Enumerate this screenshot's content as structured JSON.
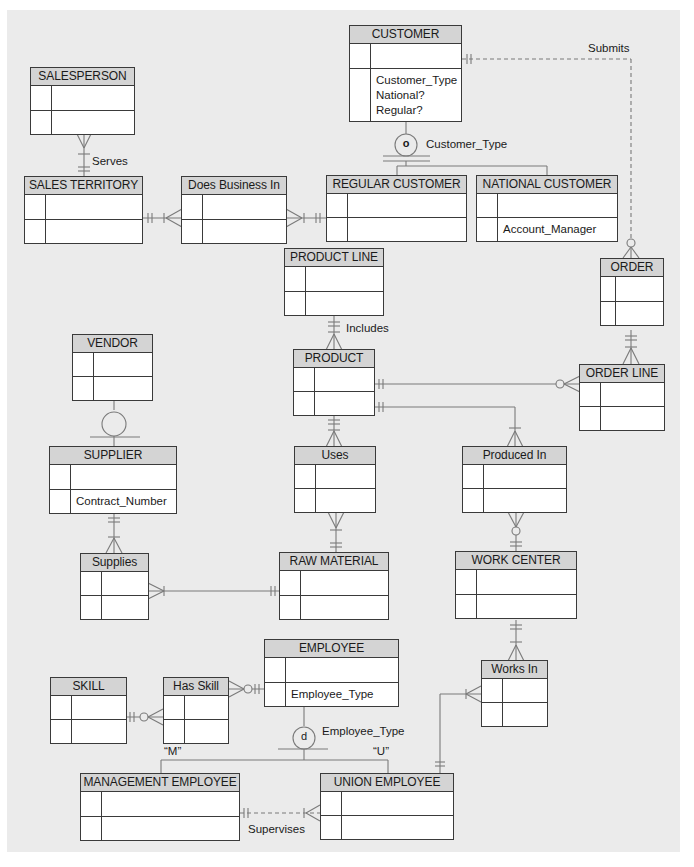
{
  "diagram": {
    "type": "Enhanced ER diagram",
    "colors": {
      "panel_bg": "#ebebeb",
      "entity_header": "#d4d4d4",
      "line": "#7a7a7a",
      "border": "#3a3a3a"
    },
    "entities": {
      "customer": {
        "name": "CUSTOMER",
        "attrs": [
          "Customer_Type",
          "National?",
          "Regular?"
        ]
      },
      "salesperson": {
        "name": "SALESPERSON"
      },
      "sales_territory": {
        "name": "SALES TERRITORY"
      },
      "does_business_in": {
        "name": "Does Business In"
      },
      "regular_customer": {
        "name": "REGULAR CUSTOMER"
      },
      "national_customer": {
        "name": "NATIONAL CUSTOMER",
        "attrs": [
          "Account_Manager"
        ]
      },
      "product_line": {
        "name": "PRODUCT LINE"
      },
      "order": {
        "name": "ORDER"
      },
      "vendor": {
        "name": "VENDOR"
      },
      "product": {
        "name": "PRODUCT"
      },
      "order_line": {
        "name": "ORDER LINE"
      },
      "supplier": {
        "name": "SUPPLIER",
        "attrs": [
          "Contract_Number"
        ]
      },
      "uses": {
        "name": "Uses"
      },
      "produced_in": {
        "name": "Produced In"
      },
      "supplies": {
        "name": "Supplies"
      },
      "raw_material": {
        "name": "RAW MATERIAL"
      },
      "work_center": {
        "name": "WORK CENTER"
      },
      "employee": {
        "name": "EMPLOYEE",
        "attrs": [
          "Employee_Type"
        ]
      },
      "skill": {
        "name": "SKILL"
      },
      "has_skill": {
        "name": "Has Skill"
      },
      "works_in": {
        "name": "Works In"
      },
      "management_employee": {
        "name": "MANAGEMENT EMPLOYEE"
      },
      "union_employee": {
        "name": "UNION EMPLOYEE"
      }
    },
    "relationship_labels": {
      "submits": "Submits",
      "serves": "Serves",
      "includes": "Includes",
      "supervises": "Supervises"
    },
    "subtype_discriminators": {
      "customer": {
        "symbol": "o",
        "label": "Customer_Type"
      },
      "employee": {
        "symbol": "d",
        "label": "Employee_Type",
        "values": [
          "“M”",
          "“U”"
        ]
      }
    }
  }
}
